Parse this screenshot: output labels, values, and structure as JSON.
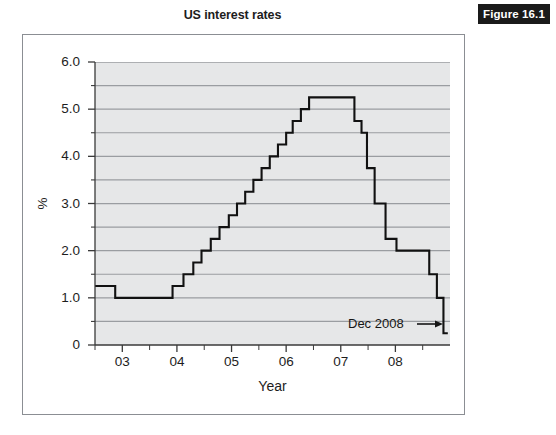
{
  "figure": {
    "badge_label": "Figure 16.1",
    "title": "US interest rates",
    "badge_bg": "#1a1a1a",
    "badge_fg": "#ffffff",
    "frame_color": "#8b8e93"
  },
  "chart_data": {
    "type": "line",
    "title": "US interest rates",
    "xlabel": "Year",
    "ylabel": "%",
    "xlim": [
      2002.5,
      2009.0
    ],
    "ylim": [
      0,
      6.0
    ],
    "grid": true,
    "legend": null,
    "line_style": "step",
    "line_color": "#111111",
    "plot_bgcolor": "#e6e7e8",
    "gridline_color": "#9a9da1",
    "x_tick_labels": [
      "03",
      "04",
      "05",
      "06",
      "07",
      "08"
    ],
    "x_tick_values": [
      2003,
      2004,
      2005,
      2006,
      2007,
      2008
    ],
    "x_minor_ticks": [
      2002.5,
      2003.5,
      2004.5,
      2005.5,
      2006.5,
      2007.5,
      2008.5
    ],
    "y_tick_labels": [
      "0",
      "1.0",
      "2.0",
      "3.0",
      "4.0",
      "5.0",
      "6.0"
    ],
    "y_tick_values": [
      0,
      1.0,
      2.0,
      3.0,
      4.0,
      5.0,
      6.0
    ],
    "y_minor_tick_values": [
      0.5,
      1.5,
      2.5,
      3.5,
      4.5,
      5.5
    ],
    "x": [
      2002.5,
      2002.87,
      2002.87,
      2003.92,
      2003.92,
      2004.12,
      2004.12,
      2004.3,
      2004.3,
      2004.45,
      2004.45,
      2004.62,
      2004.62,
      2004.78,
      2004.78,
      2004.95,
      2004.95,
      2005.1,
      2005.1,
      2005.25,
      2005.25,
      2005.4,
      2005.4,
      2005.55,
      2005.55,
      2005.7,
      2005.7,
      2005.85,
      2005.85,
      2006.0,
      2006.0,
      2006.12,
      2006.12,
      2006.27,
      2006.27,
      2006.42,
      2006.42,
      2006.55,
      2006.55,
      2007.25,
      2007.25,
      2007.38,
      2007.38,
      2007.48,
      2007.48,
      2007.62,
      2007.62,
      2007.82,
      2007.82,
      2008.02,
      2008.02,
      2008.14,
      2008.14,
      2008.28,
      2008.28,
      2008.62,
      2008.62,
      2008.76,
      2008.76,
      2008.88,
      2008.88,
      2008.96
    ],
    "y": [
      1.25,
      1.25,
      1.0,
      1.0,
      1.25,
      1.25,
      1.5,
      1.5,
      1.75,
      1.75,
      2.0,
      2.0,
      2.25,
      2.25,
      2.5,
      2.5,
      2.75,
      2.75,
      3.0,
      3.0,
      3.25,
      3.25,
      3.5,
      3.5,
      3.75,
      3.75,
      4.0,
      4.0,
      4.25,
      4.25,
      4.5,
      4.5,
      4.75,
      4.75,
      5.0,
      5.0,
      5.25,
      5.25,
      5.25,
      5.25,
      4.75,
      4.75,
      4.5,
      4.5,
      3.75,
      3.75,
      3.0,
      3.0,
      2.25,
      2.25,
      2.0,
      2.0,
      2.0,
      2.0,
      2.0,
      2.0,
      1.5,
      1.5,
      1.0,
      1.0,
      0.25,
      0.25
    ],
    "steps": [
      {
        "from": 2002.5,
        "to": 2002.87,
        "rate": 1.25
      },
      {
        "from": 2002.87,
        "to": 2003.92,
        "rate": 1.0
      },
      {
        "from": 2003.92,
        "to": 2004.12,
        "rate": 1.25
      },
      {
        "from": 2004.12,
        "to": 2004.3,
        "rate": 1.5
      },
      {
        "from": 2004.3,
        "to": 2004.45,
        "rate": 1.75
      },
      {
        "from": 2004.45,
        "to": 2004.62,
        "rate": 2.0
      },
      {
        "from": 2004.62,
        "to": 2004.78,
        "rate": 2.25
      },
      {
        "from": 2004.78,
        "to": 2004.95,
        "rate": 2.5
      },
      {
        "from": 2004.95,
        "to": 2005.1,
        "rate": 2.75
      },
      {
        "from": 2005.1,
        "to": 2005.25,
        "rate": 3.0
      },
      {
        "from": 2005.25,
        "to": 2005.4,
        "rate": 3.25
      },
      {
        "from": 2005.4,
        "to": 2005.55,
        "rate": 3.5
      },
      {
        "from": 2005.55,
        "to": 2005.7,
        "rate": 3.75
      },
      {
        "from": 2005.7,
        "to": 2005.85,
        "rate": 4.0
      },
      {
        "from": 2005.85,
        "to": 2006.0,
        "rate": 4.25
      },
      {
        "from": 2006.0,
        "to": 2006.12,
        "rate": 4.5
      },
      {
        "from": 2006.12,
        "to": 2006.27,
        "rate": 4.75
      },
      {
        "from": 2006.27,
        "to": 2006.42,
        "rate": 5.0
      },
      {
        "from": 2006.42,
        "to": 2007.25,
        "rate": 5.25
      },
      {
        "from": 2007.25,
        "to": 2007.38,
        "rate": 4.75
      },
      {
        "from": 2007.38,
        "to": 2007.48,
        "rate": 4.5
      },
      {
        "from": 2007.48,
        "to": 2007.62,
        "rate": 3.75
      },
      {
        "from": 2007.62,
        "to": 2007.82,
        "rate": 3.0
      },
      {
        "from": 2007.82,
        "to": 2008.02,
        "rate": 2.25
      },
      {
        "from": 2008.02,
        "to": 2008.62,
        "rate": 2.0
      },
      {
        "from": 2008.62,
        "to": 2008.76,
        "rate": 1.5
      },
      {
        "from": 2008.76,
        "to": 2008.88,
        "rate": 1.0
      },
      {
        "from": 2008.88,
        "to": 2008.96,
        "rate": 0.25
      }
    ],
    "annotations": [
      {
        "text": "Dec 2008",
        "points_to_x": 2008.92,
        "points_to_y": 0.25
      }
    ]
  }
}
